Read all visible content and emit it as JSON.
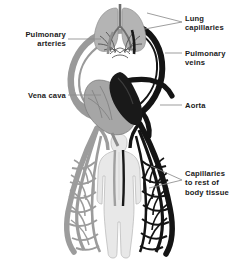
{
  "diagram": {
    "background_color": "#ffffff",
    "colors": {
      "oxygenated_vessel": "#111111",
      "deoxygenated_vessel": "#9a9a9a",
      "lung_tissue": "#b3b3b3",
      "heart_light_chamber": "#a8a8a8",
      "heart_dark_chamber": "#161616",
      "body_figure": "#e6e6e6",
      "leader_line": "#8c8c8c",
      "label_text": "#1a1a1a"
    },
    "labels": [
      {
        "id": "pulmonary-arteries",
        "text": "Pulmonary\narteries",
        "side": "left",
        "leader_from": [
          68,
          39
        ],
        "leader_to": [
          103,
          39
        ]
      },
      {
        "id": "vena-cava",
        "text": "Vena cava",
        "side": "left",
        "leader_from": [
          68,
          95
        ],
        "leader_to": [
          103,
          95
        ]
      },
      {
        "id": "lung-capillaries",
        "text": "Lung\ncapillaries",
        "side": "right",
        "leader_from": [
          182,
          23
        ],
        "leader_to": [
          146,
          14
        ]
      },
      {
        "id": "pulmonary-veins",
        "text": "Pulmonary\nveins",
        "side": "right",
        "leader_from": [
          182,
          53
        ],
        "leader_to": [
          163,
          53
        ]
      },
      {
        "id": "aorta",
        "text": "Aorta",
        "side": "right",
        "leader_from": [
          182,
          105
        ],
        "leader_to": [
          158,
          105
        ]
      },
      {
        "id": "body-capillaries",
        "text": "Capillaries\nto rest of\nbody tissue",
        "side": "right",
        "leader_from": [
          182,
          180
        ],
        "leader_to": [
          150,
          166
        ]
      }
    ],
    "structures": [
      {
        "name": "lungs",
        "description": "Paired gray lung lobes at top centre"
      },
      {
        "name": "lung-capillary-network",
        "description": "Fine vessel mesh across the lungs"
      },
      {
        "name": "heart",
        "description": "Heart at centre with dark and light chambers"
      },
      {
        "name": "aorta-arch",
        "description": "Black arterial loop leaving the heart"
      },
      {
        "name": "pulmonary-artery-loop",
        "description": "Gray vessel loop to the lungs"
      },
      {
        "name": "body-figure",
        "description": "Pale human silhouette, lower half of image"
      },
      {
        "name": "body-capillary-network",
        "description": "Branching vessel mesh beside the body"
      }
    ]
  }
}
